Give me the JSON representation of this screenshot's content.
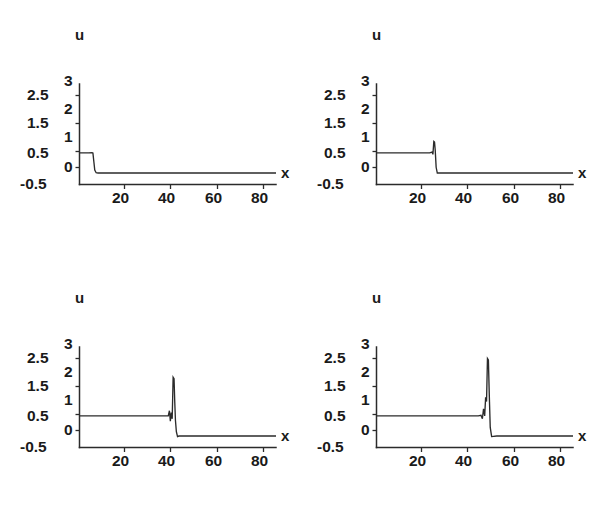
{
  "figure": {
    "background_color": "#ffffff",
    "ink_color": "#2b2b2b",
    "panel_count": 4
  },
  "labels": {
    "y_axis_name": "u",
    "x_axis_name": "x",
    "y_ticks": [
      "3",
      "2.5",
      "2",
      "1.5",
      "1",
      "0.5",
      "0",
      "-0.5"
    ],
    "x_ticks": [
      "20",
      "40",
      "60",
      "80"
    ]
  },
  "chart_data": [
    {
      "type": "line",
      "panel": "top-left",
      "title": "",
      "xlabel": "x",
      "ylabel": "u",
      "xlim": [
        0,
        85
      ],
      "ylim": [
        -0.5,
        3
      ],
      "xticks": [
        20,
        40,
        60,
        80
      ],
      "yticks": [
        -0.5,
        0,
        0.5,
        1,
        1.5,
        2,
        2.5,
        3
      ],
      "grid": false,
      "legend": "none",
      "annotation": "plateau u=0.6 ends near x=6; sharp drop to u=-0.1",
      "plateau_value": 0.6,
      "baseline_value": -0.1,
      "front_position": 6,
      "peak_value": 0.62,
      "x": [
        0,
        2,
        4,
        5.4,
        5.8,
        6.2,
        6.6,
        7.2,
        8,
        12,
        20,
        30,
        40,
        50,
        60,
        70,
        80,
        85
      ],
      "y": [
        0.6,
        0.6,
        0.6,
        0.61,
        0.6,
        0.3,
        0.0,
        -0.09,
        -0.1,
        -0.1,
        -0.1,
        -0.1,
        -0.1,
        -0.1,
        -0.1,
        -0.1,
        -0.1,
        -0.1
      ]
    },
    {
      "type": "line",
      "panel": "top-right",
      "title": "",
      "xlabel": "x",
      "ylabel": "u",
      "xlim": [
        0,
        85
      ],
      "ylim": [
        -0.5,
        3
      ],
      "xticks": [
        20,
        40,
        60,
        80
      ],
      "yticks": [
        -0.5,
        0,
        0.5,
        1,
        1.5,
        2,
        2.5,
        3
      ],
      "grid": false,
      "legend": "none",
      "annotation": "plateau u=0.6 to x=24; overshoot spike to u=1.0 at x=25; drop to u=-0.1",
      "plateau_value": 0.6,
      "baseline_value": -0.1,
      "front_position": 25,
      "peak_value": 1.0,
      "x": [
        0,
        5,
        10,
        15,
        20,
        23,
        24,
        24.4,
        24.8,
        25.1,
        25.4,
        25.8,
        26.3,
        27,
        30,
        40,
        50,
        60,
        70,
        80,
        85
      ],
      "y": [
        0.6,
        0.6,
        0.6,
        0.6,
        0.6,
        0.6,
        0.63,
        0.55,
        1.0,
        0.98,
        0.7,
        0.1,
        -0.1,
        -0.1,
        -0.1,
        -0.1,
        -0.1,
        -0.1,
        -0.1,
        -0.1,
        -0.1
      ]
    },
    {
      "type": "line",
      "panel": "bottom-left",
      "title": "",
      "xlabel": "x",
      "ylabel": "u",
      "xlim": [
        0,
        85
      ],
      "ylim": [
        -0.5,
        3
      ],
      "xticks": [
        20,
        40,
        60,
        80
      ],
      "yticks": [
        -0.5,
        0,
        0.5,
        1,
        1.5,
        2,
        2.5,
        3
      ],
      "grid": false,
      "legend": "none",
      "annotation": "plateau u=0.6 to x=39 with small oscillation; spike to u=1.95 at x=41; drop to u=-0.1",
      "plateau_value": 0.6,
      "baseline_value": -0.1,
      "front_position": 41,
      "peak_value": 1.95,
      "x": [
        0,
        10,
        20,
        30,
        36,
        38.4,
        38.9,
        39.3,
        39.7,
        40.1,
        40.5,
        40.9,
        41.2,
        41.5,
        41.9,
        42.4,
        43,
        50,
        60,
        70,
        80,
        85
      ],
      "y": [
        0.6,
        0.6,
        0.6,
        0.6,
        0.6,
        0.6,
        0.78,
        0.42,
        0.72,
        0.5,
        1.95,
        1.9,
        1.1,
        0.45,
        0.05,
        -0.12,
        -0.1,
        -0.1,
        -0.1,
        -0.1,
        -0.1,
        -0.1
      ]
    },
    {
      "type": "line",
      "panel": "bottom-right",
      "title": "",
      "xlabel": "x",
      "ylabel": "u",
      "xlim": [
        0,
        85
      ],
      "ylim": [
        -0.5,
        3
      ],
      "xticks": [
        20,
        40,
        60,
        80
      ],
      "yticks": [
        -0.5,
        0,
        0.5,
        1,
        1.5,
        2,
        2.5,
        3
      ],
      "grid": false,
      "legend": "none",
      "annotation": "plateau u=0.6 to x=45 with oscillation; spike to u=2.6 at x=48; drop to u=-0.1",
      "plateau_value": 0.6,
      "baseline_value": -0.1,
      "front_position": 48,
      "peak_value": 2.6,
      "x": [
        0,
        10,
        20,
        30,
        40,
        44,
        45.2,
        45.8,
        46.3,
        46.8,
        47.2,
        47.6,
        48.0,
        48.4,
        48.8,
        49.2,
        49.8,
        52,
        60,
        70,
        80,
        85
      ],
      "y": [
        0.6,
        0.6,
        0.6,
        0.6,
        0.6,
        0.6,
        0.62,
        0.5,
        0.85,
        0.6,
        1.25,
        1.1,
        2.6,
        2.55,
        1.3,
        0.2,
        -0.12,
        -0.1,
        -0.1,
        -0.1,
        -0.1,
        -0.1
      ]
    }
  ]
}
